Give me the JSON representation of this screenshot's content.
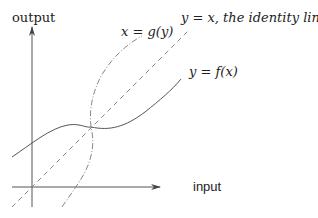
{
  "axes": {
    "y_label": "output",
    "x_label": "input"
  },
  "curves": [
    {
      "id": "f",
      "label": "y = f(x)",
      "style": "solid",
      "color": "#555555"
    },
    {
      "id": "identity",
      "label": "y = x, the identity line",
      "style": "dashed",
      "color": "#888888"
    },
    {
      "id": "g",
      "label": "x = g(y)",
      "style": "dash-dot",
      "color": "#888888"
    }
  ],
  "labels": {
    "f": "y = f(x)",
    "identity": "y = x, the identity line",
    "g": "x = g(y)"
  }
}
